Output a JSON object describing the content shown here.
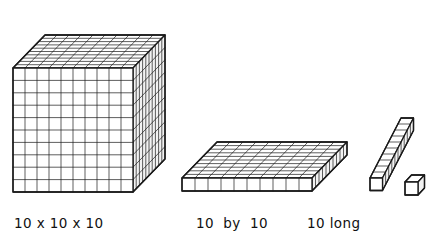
{
  "figure": {
    "background_color": "#ffffff",
    "stroke_color": "#1a1a1a",
    "face_fill_color": "#ffffff",
    "shade_fill_color": "#f2f2f2",
    "labels": {
      "cube": "10 x 10 x 10",
      "flat": "10  by  10",
      "rod": "10 long"
    },
    "blocks": [
      {
        "name": "thousand-cube",
        "label": "10 x 10 x 10",
        "units_wide": 10,
        "units_tall": 10,
        "units_deep": 10,
        "unit_count": 1000,
        "projection": "oblique"
      },
      {
        "name": "hundred-flat",
        "label": "10  by  10",
        "units_wide": 10,
        "units_tall": 1,
        "units_deep": 10,
        "unit_count": 100,
        "projection": "oblique"
      },
      {
        "name": "ten-rod",
        "label": "10 long",
        "units_wide": 10,
        "units_tall": 1,
        "units_deep": 1,
        "unit_count": 10,
        "projection": "oblique"
      },
      {
        "name": "unit-cube",
        "label": "",
        "units_wide": 1,
        "units_tall": 1,
        "units_deep": 1,
        "unit_count": 1,
        "projection": "oblique"
      }
    ]
  }
}
